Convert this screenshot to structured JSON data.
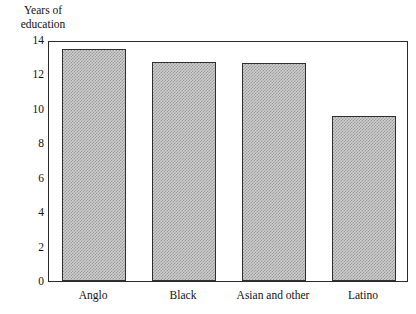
{
  "chart_data": {
    "type": "bar",
    "title": "",
    "ylabel": "Years of education",
    "ylabel_lines": [
      "Years of",
      "education"
    ],
    "xlabel": "",
    "categories": [
      "Anglo",
      "Black",
      "Asian and other",
      "Latino"
    ],
    "values": [
      13.5,
      12.7,
      12.65,
      9.6
    ],
    "ylim": [
      0,
      14
    ],
    "yticks": [
      0,
      2,
      4,
      6,
      8,
      10,
      12,
      14
    ],
    "ytick_labels": [
      "0",
      "2",
      "4",
      "6",
      "8",
      "10",
      "12",
      "14"
    ],
    "grid": false,
    "legend": null,
    "bar_fill_color": "#cfcfcf",
    "bar_edge_color": "#2f2f2f",
    "frame_color": "#2b2b2b",
    "background_color": "#ffffff"
  }
}
